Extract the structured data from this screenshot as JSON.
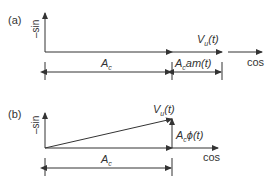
{
  "panels": [
    {
      "label": "(a)",
      "y_axis_label": "–sin",
      "x_axis_label": "cos",
      "vector_label_main": "V",
      "vector_label_sub": "u",
      "vector_label_arg": "(t)",
      "dim1_main": "A",
      "dim1_sub": "c",
      "dim2_main": "A",
      "dim2_sub": "c",
      "dim2_rest": "am(t)"
    },
    {
      "label": "(b)",
      "y_axis_label": "–sin",
      "x_axis_label": "cos",
      "vector_label_main": "V",
      "vector_label_sub": "u",
      "vector_label_arg": "(t)",
      "dim1_main": "A",
      "dim1_sub": "c",
      "phase_main": "A",
      "phase_sub": "c",
      "phase_rest": "ϕ(t)"
    }
  ],
  "colors": {
    "line": "#333333"
  }
}
